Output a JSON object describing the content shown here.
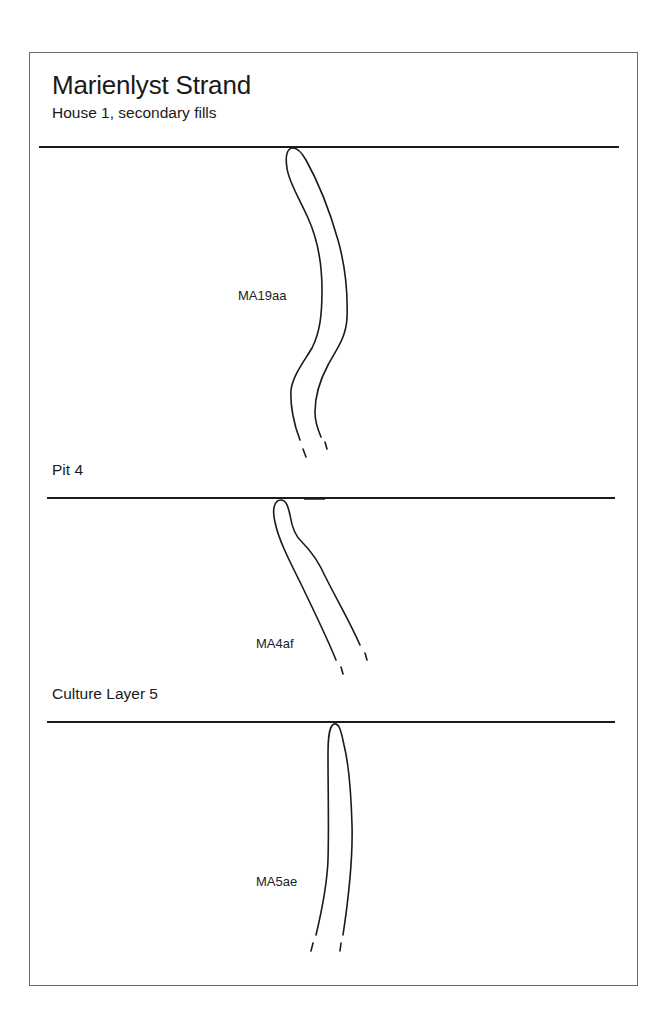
{
  "header": {
    "title": "Marienlyst Strand",
    "subtitle": "House 1, secondary fills"
  },
  "sections": [
    {
      "id": "house-1",
      "label": "",
      "sample": "MA19aa"
    },
    {
      "id": "pit-4",
      "label": "Pit 4",
      "sample": "MA4af"
    },
    {
      "id": "culture-layer-5",
      "label": "Culture Layer 5",
      "sample": "MA5ae"
    }
  ],
  "colors": {
    "line": "#1a1a1a",
    "frame": "#6a6a6a",
    "background": "#ffffff"
  }
}
